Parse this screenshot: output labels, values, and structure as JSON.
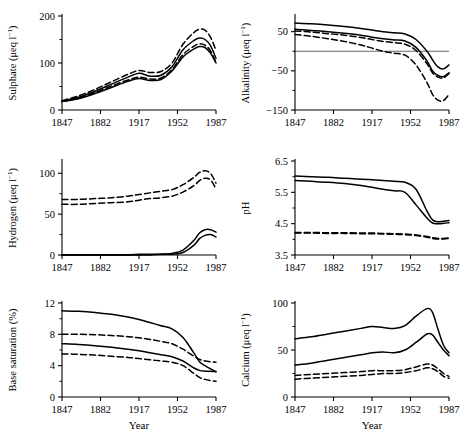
{
  "figure": {
    "title": "",
    "rows": 3,
    "cols": 2,
    "xlabel": "Year",
    "line_styles": [
      "solid",
      "solid",
      "dashed",
      "dashed"
    ],
    "series_count": 4
  },
  "chart_data": [
    {
      "id": "sulphate",
      "type": "line",
      "title": "",
      "xlabel": "Year",
      "ylabel": "Sulphate (μeq l⁻¹)",
      "ylabel_text": "Sulphate",
      "yunit": "(μeq l⁻¹)",
      "xlim": [
        1847,
        1987
      ],
      "ylim": [
        0,
        200
      ],
      "xticks": [
        1847,
        1882,
        1917,
        1952,
        1987
      ],
      "yticks": [
        0,
        100,
        200
      ],
      "yminor": [
        50,
        150
      ],
      "grid": false,
      "zero_line": false,
      "x": [
        1847,
        1862,
        1877,
        1892,
        1907,
        1917,
        1927,
        1937,
        1947,
        1957,
        1967,
        1972,
        1977,
        1982,
        1987
      ],
      "series": [
        {
          "name": "A",
          "style": "dashed",
          "values": [
            20,
            30,
            44,
            60,
            76,
            84,
            80,
            82,
            100,
            140,
            165,
            172,
            170,
            155,
            127
          ]
        },
        {
          "name": "B",
          "style": "solid",
          "values": [
            19,
            27,
            40,
            55,
            70,
            78,
            72,
            74,
            92,
            128,
            148,
            153,
            150,
            137,
            110
          ]
        },
        {
          "name": "C",
          "style": "dashed",
          "values": [
            18,
            25,
            37,
            51,
            64,
            70,
            66,
            68,
            86,
            118,
            136,
            141,
            138,
            126,
            101
          ]
        },
        {
          "name": "D",
          "style": "solid",
          "values": [
            18,
            24,
            35,
            48,
            61,
            67,
            63,
            65,
            83,
            113,
            130,
            135,
            133,
            121,
            100
          ]
        }
      ]
    },
    {
      "id": "alkalinity",
      "type": "line",
      "title": "",
      "xlabel": "Year",
      "ylabel": "Alkalinity (μeq l⁻¹)",
      "ylabel_text": "Alkalinity",
      "yunit": "(μeq l⁻¹)",
      "xlim": [
        1847,
        1987
      ],
      "ylim": [
        -150,
        90
      ],
      "xticks": [
        1847,
        1882,
        1917,
        1952,
        1987
      ],
      "yticks": [
        50,
        -50,
        -150
      ],
      "yminor": [
        0,
        -100
      ],
      "grid": false,
      "zero_line": true,
      "zero_line_value": 0,
      "x": [
        1847,
        1862,
        1877,
        1892,
        1907,
        1917,
        1927,
        1937,
        1947,
        1957,
        1967,
        1972,
        1977,
        1982,
        1987
      ],
      "series": [
        {
          "name": "A",
          "style": "solid",
          "values": [
            72,
            70,
            67,
            63,
            58,
            54,
            50,
            47,
            44,
            30,
            0,
            -22,
            -40,
            -45,
            -35
          ]
        },
        {
          "name": "B",
          "style": "solid",
          "values": [
            56,
            53,
            50,
            46,
            41,
            36,
            32,
            29,
            26,
            10,
            -25,
            -50,
            -62,
            -65,
            -55
          ]
        },
        {
          "name": "C",
          "style": "dashed",
          "values": [
            52,
            49,
            45,
            41,
            35,
            30,
            25,
            22,
            18,
            2,
            -32,
            -55,
            -66,
            -68,
            -57
          ]
        },
        {
          "name": "D",
          "style": "dashed",
          "values": [
            43,
            38,
            32,
            25,
            16,
            8,
            0,
            -5,
            -10,
            -35,
            -80,
            -110,
            -125,
            -126,
            -110
          ]
        }
      ]
    },
    {
      "id": "hydrogen",
      "type": "line",
      "title": "",
      "xlabel": "Year",
      "ylabel": "Hydrogen (μeq l⁻¹)",
      "ylabel_text": "Hydrogen",
      "yunit": "(μeq l⁻¹)",
      "xlim": [
        1847,
        1987
      ],
      "ylim": [
        0,
        115
      ],
      "xticks": [
        1847,
        1882,
        1917,
        1952,
        1987
      ],
      "yticks": [
        0,
        50,
        100
      ],
      "yminor": [
        25,
        75
      ],
      "grid": false,
      "zero_line": false,
      "x": [
        1847,
        1862,
        1877,
        1892,
        1907,
        1917,
        1927,
        1937,
        1947,
        1957,
        1967,
        1972,
        1977,
        1982,
        1987
      ],
      "series": [
        {
          "name": "A",
          "style": "dashed",
          "values": [
            68,
            68,
            69,
            70,
            72,
            74,
            76,
            78,
            80,
            86,
            95,
            101,
            103,
            100,
            88
          ]
        },
        {
          "name": "B",
          "style": "dashed",
          "values": [
            62,
            62,
            63,
            64,
            65,
            67,
            69,
            70,
            72,
            77,
            85,
            91,
            94,
            92,
            81
          ]
        },
        {
          "name": "C",
          "style": "solid",
          "values": [
            0,
            0,
            0,
            0,
            0,
            1,
            1,
            1,
            2,
            6,
            18,
            27,
            31,
            31,
            28
          ]
        },
        {
          "name": "D",
          "style": "solid",
          "values": [
            0,
            0,
            0,
            0,
            0,
            0,
            0,
            1,
            1,
            3,
            12,
            20,
            24,
            25,
            22
          ]
        }
      ]
    },
    {
      "id": "ph",
      "type": "line",
      "title": "",
      "xlabel": "Year",
      "ylabel": "pH",
      "ylabel_text": "pH",
      "yunit": "",
      "xlim": [
        1847,
        1987
      ],
      "ylim": [
        3.5,
        6.5
      ],
      "xticks": [
        1847,
        1882,
        1917,
        1952,
        1987
      ],
      "yticks": [
        3.5,
        4.5,
        5.5,
        6.5
      ],
      "yminor": [
        4.0,
        5.0,
        6.0
      ],
      "grid": false,
      "zero_line": false,
      "x": [
        1847,
        1862,
        1877,
        1892,
        1907,
        1917,
        1927,
        1937,
        1947,
        1957,
        1967,
        1972,
        1977,
        1982,
        1987
      ],
      "series": [
        {
          "name": "A",
          "style": "solid",
          "values": [
            6.02,
            6.0,
            5.98,
            5.95,
            5.92,
            5.9,
            5.88,
            5.85,
            5.82,
            5.6,
            4.9,
            4.62,
            4.56,
            4.58,
            4.6
          ]
        },
        {
          "name": "B",
          "style": "solid",
          "values": [
            5.88,
            5.85,
            5.82,
            5.78,
            5.72,
            5.66,
            5.6,
            5.55,
            5.5,
            5.1,
            4.68,
            4.52,
            4.5,
            4.51,
            4.53
          ]
        },
        {
          "name": "C",
          "style": "dashed",
          "values": [
            4.22,
            4.22,
            4.21,
            4.21,
            4.2,
            4.2,
            4.19,
            4.18,
            4.17,
            4.14,
            4.09,
            4.05,
            4.03,
            4.03,
            4.05
          ]
        },
        {
          "name": "D",
          "style": "dashed",
          "values": [
            4.2,
            4.2,
            4.19,
            4.19,
            4.18,
            4.18,
            4.17,
            4.16,
            4.15,
            4.12,
            4.07,
            4.03,
            4.01,
            4.01,
            4.03
          ]
        }
      ]
    },
    {
      "id": "base_saturation",
      "type": "line",
      "title": "",
      "xlabel": "Year",
      "ylabel": "Base saturation (%)",
      "ylabel_text": "Base saturation (%)",
      "yunit": "(%)",
      "xlim": [
        1847,
        1987
      ],
      "ylim": [
        0,
        12
      ],
      "xticks": [
        1847,
        1882,
        1917,
        1952,
        1987
      ],
      "yticks": [
        0,
        4,
        8,
        12
      ],
      "yminor": [
        2,
        6,
        10
      ],
      "grid": false,
      "zero_line": false,
      "x": [
        1847,
        1862,
        1877,
        1892,
        1907,
        1917,
        1927,
        1937,
        1947,
        1957,
        1967,
        1972,
        1977,
        1982,
        1987
      ],
      "series": [
        {
          "name": "A",
          "style": "solid",
          "values": [
            11.0,
            10.95,
            10.8,
            10.55,
            10.2,
            9.9,
            9.5,
            9.1,
            8.7,
            7.6,
            5.6,
            4.5,
            4.0,
            3.6,
            3.2
          ]
        },
        {
          "name": "B",
          "style": "dashed",
          "values": [
            8.0,
            8.0,
            7.95,
            7.85,
            7.7,
            7.55,
            7.35,
            7.1,
            6.8,
            6.1,
            5.2,
            4.8,
            4.6,
            4.5,
            4.45
          ]
        },
        {
          "name": "C",
          "style": "solid",
          "values": [
            6.8,
            6.7,
            6.55,
            6.35,
            6.1,
            5.9,
            5.65,
            5.4,
            5.15,
            4.6,
            3.7,
            3.4,
            3.3,
            3.28,
            3.25
          ]
        },
        {
          "name": "D",
          "style": "dashed",
          "values": [
            5.5,
            5.45,
            5.35,
            5.2,
            5.05,
            4.9,
            4.75,
            4.6,
            4.45,
            4.0,
            3.0,
            2.5,
            2.25,
            2.1,
            2.0
          ]
        }
      ]
    },
    {
      "id": "calcium",
      "type": "line",
      "title": "",
      "xlabel": "Year",
      "ylabel": "Calcium (μeq l⁻¹)",
      "ylabel_text": "Calcium",
      "yunit": "(μeq l⁻¹)",
      "xlim": [
        1847,
        1987
      ],
      "ylim": [
        0,
        100
      ],
      "xticks": [
        1847,
        1882,
        1917,
        1952,
        1987
      ],
      "yticks": [
        0,
        50,
        100
      ],
      "yminor": [
        25,
        75
      ],
      "grid": false,
      "zero_line": false,
      "x": [
        1847,
        1862,
        1877,
        1892,
        1907,
        1917,
        1927,
        1937,
        1947,
        1957,
        1967,
        1972,
        1977,
        1982,
        1987
      ],
      "series": [
        {
          "name": "A",
          "style": "solid",
          "values": [
            62,
            64,
            67,
            70,
            73,
            75,
            74,
            73,
            76,
            86,
            94,
            90,
            72,
            55,
            47
          ]
        },
        {
          "name": "B",
          "style": "solid",
          "values": [
            34,
            36,
            39,
            42,
            45,
            47,
            48,
            47,
            50,
            58,
            67,
            66,
            58,
            50,
            44
          ]
        },
        {
          "name": "C",
          "style": "dashed",
          "values": [
            23,
            24,
            25,
            26,
            27,
            28,
            28,
            28,
            29,
            32,
            35,
            34,
            30,
            25,
            22
          ]
        },
        {
          "name": "D",
          "style": "dashed",
          "values": [
            19,
            20,
            21,
            22,
            23,
            24,
            25,
            25,
            26,
            28,
            31,
            30,
            27,
            22,
            20
          ]
        }
      ]
    }
  ],
  "axis_text": {
    "xlabel": "Year",
    "xticks": [
      "1847",
      "1882",
      "1917",
      "1952",
      "1987"
    ],
    "panels": {
      "sulphate": {
        "ylabel": "Sulphate (μeq l⁻¹)",
        "yticks": [
          "0",
          "100",
          "200"
        ]
      },
      "alkalinity": {
        "ylabel": "Alkalinity (μeq l⁻¹)",
        "yticks": [
          "50",
          "−50",
          "−150"
        ]
      },
      "hydrogen": {
        "ylabel": "Hydrogen (μeq l⁻¹)",
        "yticks": [
          "0",
          "50",
          "100"
        ]
      },
      "ph": {
        "ylabel": "pH",
        "yticks": [
          "3.5",
          "4.5",
          "5.5",
          "6.5"
        ]
      },
      "base_saturation": {
        "ylabel": "Base saturation (%)",
        "yticks": [
          "0",
          "4",
          "8",
          "12"
        ]
      },
      "calcium": {
        "ylabel": "Calcium (μeq l⁻¹)",
        "yticks": [
          "0",
          "50",
          "100"
        ]
      }
    }
  },
  "style": {
    "line_color": "#000000",
    "axis_color": "#000000",
    "background": "#ffffff",
    "zero_line_color": "#555555"
  }
}
